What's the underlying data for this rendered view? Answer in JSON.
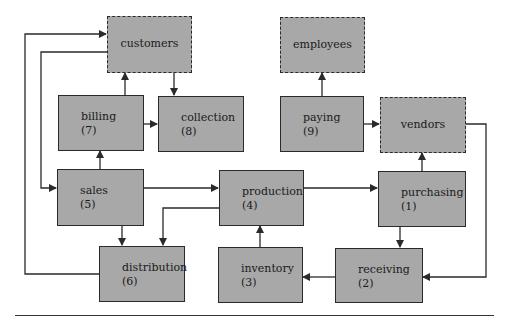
{
  "diagram": {
    "type": "data-flow",
    "external_entities": [
      {
        "id": "customers",
        "label": "customers"
      },
      {
        "id": "employees",
        "label": "employees"
      },
      {
        "id": "vendors",
        "label": "vendors"
      }
    ],
    "processes": [
      {
        "id": "purchasing",
        "label": "purchasing",
        "number": "(1)"
      },
      {
        "id": "receiving",
        "label": "receiving",
        "number": "(2)"
      },
      {
        "id": "inventory",
        "label": "inventory",
        "number": "(3)"
      },
      {
        "id": "production",
        "label": "production",
        "number": "(4)"
      },
      {
        "id": "sales",
        "label": "sales",
        "number": "(5)"
      },
      {
        "id": "distribution",
        "label": "distribution",
        "number": "(6)"
      },
      {
        "id": "billing",
        "label": "billing",
        "number": "(7)"
      },
      {
        "id": "collection",
        "label": "collection",
        "number": "(8)"
      },
      {
        "id": "paying",
        "label": "paying",
        "number": "(9)"
      }
    ],
    "edges": [
      {
        "from": "billing",
        "to": "customers"
      },
      {
        "from": "customers",
        "to": "collection"
      },
      {
        "from": "billing",
        "to": "collection"
      },
      {
        "from": "paying",
        "to": "employees"
      },
      {
        "from": "paying",
        "to": "vendors"
      },
      {
        "from": "customers",
        "to": "sales"
      },
      {
        "from": "distribution",
        "to": "customers"
      },
      {
        "from": "sales",
        "to": "billing"
      },
      {
        "from": "sales",
        "to": "production"
      },
      {
        "from": "sales",
        "to": "distribution"
      },
      {
        "from": "production",
        "to": "distribution"
      },
      {
        "from": "production",
        "to": "purchasing"
      },
      {
        "from": "purchasing",
        "to": "vendors"
      },
      {
        "from": "purchasing",
        "to": "receiving"
      },
      {
        "from": "vendors",
        "to": "receiving"
      },
      {
        "from": "receiving",
        "to": "inventory"
      },
      {
        "from": "inventory",
        "to": "production"
      }
    ],
    "colors": {
      "box_fill": "#a8a8a8",
      "line": "#2a2a2a"
    }
  }
}
